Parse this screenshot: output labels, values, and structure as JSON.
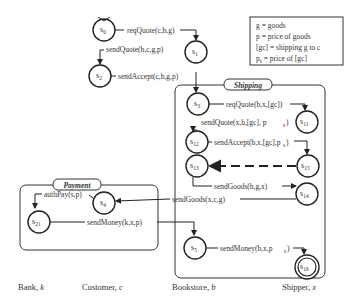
{
  "legend": {
    "lines": [
      "g = goods",
      "p = price of goods",
      "[gc] = shipping g to c",
      "p_s = price of [gc]"
    ]
  },
  "groups": {
    "shipping": "Shipping",
    "payment": "Payment"
  },
  "roles": [
    {
      "name": "Bank",
      "var": "k"
    },
    {
      "name": "Customer",
      "var": "c"
    },
    {
      "name": "Bookstore",
      "var": "b"
    },
    {
      "name": "Shipper",
      "var": "x"
    }
  ],
  "states": {
    "s0": {
      "base": "s",
      "sub": "0"
    },
    "s1": {
      "base": "s",
      "sub": "1"
    },
    "s2": {
      "base": "s",
      "sub": "2"
    },
    "s3": {
      "base": "s",
      "sub": "3"
    },
    "s11": {
      "base": "s",
      "sub": "11"
    },
    "s12": {
      "base": "s",
      "sub": "12"
    },
    "s13": {
      "base": "s",
      "sub": "13"
    },
    "s15": {
      "base": "s",
      "sub": "15"
    },
    "s14": {
      "base": "s",
      "sub": "14"
    },
    "s4": {
      "base": "s",
      "sub": "4"
    },
    "s21": {
      "base": "s",
      "sub": "21"
    },
    "s5": {
      "base": "s",
      "sub": "5"
    },
    "s16": {
      "base": "s",
      "sub": "16"
    }
  },
  "transitions": {
    "t1": "reqQuote(c,b,g)",
    "t2": "sendQuote(b,c,g,p)",
    "t3": "sendAccept(c,b,g,p)",
    "t4": "reqQuote(b,x,[gc])",
    "t5": "sendQuote(x,b,[gc], p",
    "t5s": "s",
    "t6": "sendAccept(b,x,[gc],p",
    "t6s": "s",
    "t7": "sendGoods(b,g,x)",
    "t8": "sendGoods(x,c,g)",
    "t9": "authPay(s,p)",
    "t10": "sendMoney(k,x,p)",
    "t11": "sendMoney(b,x,p",
    "t11s": "s"
  }
}
